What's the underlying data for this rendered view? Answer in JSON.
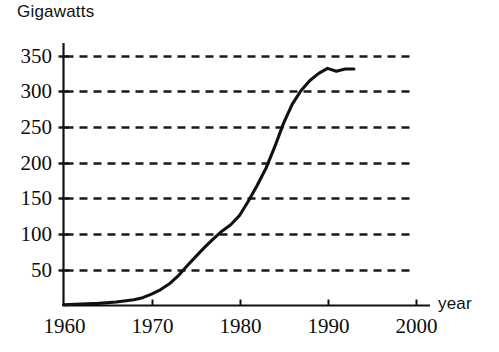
{
  "chart_data": {
    "type": "line",
    "title": "",
    "subtitle": "",
    "xlabel": "year",
    "ylabel": "Gigawatts",
    "xlim": [
      1960,
      2000
    ],
    "ylim": [
      0,
      360
    ],
    "grid": "horizontal-dashed",
    "legend": null,
    "annotations": [],
    "x_ticks": [
      1960,
      1970,
      1980,
      1990,
      2000
    ],
    "x_tick_labels": [
      "1960",
      "1970",
      "1980",
      "1990",
      "2000"
    ],
    "y_ticks": [
      50,
      100,
      150,
      200,
      250,
      300,
      350
    ],
    "y_tick_labels": [
      "50",
      "100",
      "150",
      "200",
      "250",
      "300",
      "350"
    ],
    "series": [
      {
        "name": "Installed nuclear capacity",
        "color": "#111111",
        "x": [
          1960,
          1962,
          1964,
          1966,
          1968,
          1969,
          1970,
          1971,
          1972,
          1973,
          1974,
          1975,
          1976,
          1977,
          1978,
          1979,
          1980,
          1981,
          1982,
          1983,
          1984,
          1985,
          1986,
          1987,
          1988,
          1989,
          1990,
          1991,
          1992,
          1993
        ],
        "values": [
          1,
          2,
          3,
          5,
          8,
          11,
          16,
          22,
          30,
          41,
          55,
          68,
          81,
          93,
          104,
          113,
          126,
          146,
          168,
          192,
          222,
          255,
          282,
          301,
          315,
          325,
          332,
          328,
          331,
          331
        ]
      }
    ]
  },
  "axis_titles": {
    "y": "Gigawatts",
    "x": "year"
  }
}
